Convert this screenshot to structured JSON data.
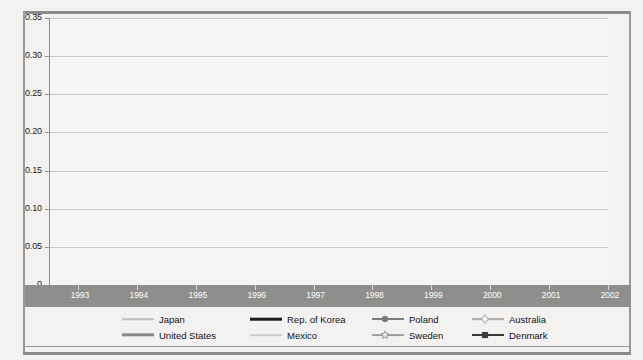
{
  "chart_data": {
    "type": "line",
    "title": "",
    "xlabel": "",
    "ylabel": "",
    "x": [
      1993,
      1994,
      1995,
      1996,
      1997,
      1998,
      1999,
      2000,
      2001,
      2002
    ],
    "categories": [
      "1993",
      "1994",
      "1995",
      "1996",
      "1997",
      "1998",
      "1999",
      "2000",
      "2001",
      "2002"
    ],
    "ylim": [
      0,
      0.35
    ],
    "xlim": [
      1993,
      2002
    ],
    "yticks": [
      "0",
      "0.05",
      "0.10",
      "0.15",
      "0.20",
      "0.25",
      "0.30",
      "0.35"
    ],
    "ytick_values": [
      0,
      0.05,
      0.1,
      0.15,
      0.2,
      0.25,
      0.3,
      0.35
    ],
    "grid": true,
    "legend_position": "bottom",
    "series": [
      {
        "name": "Japan",
        "color": "#c2c2c0",
        "width": 1.6,
        "marker": "none",
        "values": [
          0.168,
          0.172,
          0.175,
          0.177,
          0.178,
          0.18,
          0.183,
          0.186,
          0.19,
          0.195
        ]
      },
      {
        "name": "United States",
        "color": "#8a8a88",
        "width": 3.4,
        "marker": "none",
        "values": [
          0.259,
          0.259,
          0.261,
          0.266,
          0.272,
          0.306,
          0.311,
          0.315,
          0.32,
          0.321
        ]
      },
      {
        "name": "Rep. of Korea",
        "color": "#1a1a1a",
        "width": 2.6,
        "marker": "none",
        "values": [
          0.172,
          0.177,
          0.182,
          0.186,
          0.19,
          0.193,
          0.192,
          0.19,
          0.196,
          0.211
        ]
      },
      {
        "name": "Mexico",
        "color": "#cfcfcd",
        "width": 1.6,
        "marker": "none",
        "values": [
          0.155,
          0.157,
          0.16,
          0.168,
          0.177,
          0.154,
          0.133,
          0.121,
          0.117,
          0.133
        ]
      },
      {
        "name": "Poland",
        "color": "#7a7a78",
        "width": 2.0,
        "marker": "circle",
        "values": [
          0.07,
          0.092,
          0.092,
          0.097,
          0.11,
          0.131,
          0.14,
          0.148,
          0.161,
          null
        ]
      },
      {
        "name": "Sweden",
        "color": "#9c9c9a",
        "width": 1.8,
        "marker": "star",
        "values": [
          0.244,
          0.236,
          0.232,
          0.235,
          0.235,
          0.234,
          0.238,
          0.242,
          0.246,
          0.246
        ]
      },
      {
        "name": "Australia",
        "color": "#b0b0ae",
        "width": 1.8,
        "marker": "diamond",
        "values": [
          0.259,
          0.258,
          0.256,
          0.262,
          0.269,
          0.276,
          0.283,
          0.29,
          0.292,
          0.292
        ]
      },
      {
        "name": "Denmark",
        "color": "#3a3a3a",
        "width": 2.0,
        "marker": "square",
        "values": [
          0.232,
          0.233,
          0.225,
          0.235,
          0.223,
          0.228,
          0.232,
          0.233,
          0.243,
          0.246
        ]
      }
    ]
  },
  "legend": {
    "items": [
      {
        "label": "Japan",
        "key": "japan"
      },
      {
        "label": "Rep. of Korea",
        "key": "korea"
      },
      {
        "label": "Poland",
        "key": "poland"
      },
      {
        "label": "Australia",
        "key": "australia"
      },
      {
        "label": "United States",
        "key": "united-states"
      },
      {
        "label": "Mexico",
        "key": "mexico"
      },
      {
        "label": "Sweden",
        "key": "sweden"
      },
      {
        "label": "Denmark",
        "key": "denmark"
      }
    ]
  },
  "colors": {
    "background": "#f4f3f1",
    "plot_background": "#f7f6f4",
    "gridline": "#c9c9c7",
    "axis": "#8f8f8d",
    "axis_band": "#8f8f8d",
    "axis_band_text": "#ffffff",
    "frame": "#8c8c8c"
  }
}
